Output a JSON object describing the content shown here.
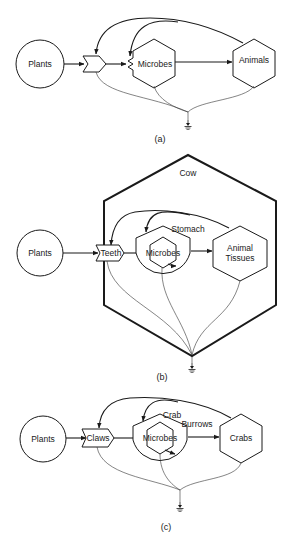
{
  "diagram": {
    "type": "energy-flow-systems",
    "panels": [
      {
        "id": "a",
        "caption": "(a)",
        "nodes": {
          "source": "Plants",
          "consumer_1": "Microbes",
          "consumer_2": "Animals"
        },
        "interaction_gates": 2,
        "flows": [
          {
            "from": "Plants",
            "to": "gate-1"
          },
          {
            "from": "gate-1",
            "to": "Microbes"
          },
          {
            "from": "Microbes",
            "to": "Animals"
          },
          {
            "from": "Animals",
            "to": "gate-1",
            "type": "feedback"
          },
          {
            "from": "Animals",
            "to": "gate-2",
            "type": "feedback"
          },
          {
            "from": "gate-1",
            "to": "heat-sink"
          },
          {
            "from": "Microbes",
            "to": "heat-sink"
          },
          {
            "from": "Animals",
            "to": "heat-sink"
          }
        ]
      },
      {
        "id": "b",
        "caption": "(b)",
        "system_boundary": "Cow",
        "nodes": {
          "source": "Plants",
          "gate": "Teeth",
          "container": "Stomach",
          "consumer_1": "Microbes",
          "consumer_2_line1": "Animal",
          "consumer_2_line2": "Tissues"
        },
        "flows": [
          {
            "from": "Plants",
            "to": "Teeth"
          },
          {
            "from": "Teeth",
            "to": "Microbes"
          },
          {
            "from": "Microbes",
            "to": "Animal Tissues"
          },
          {
            "from": "Animal Tissues",
            "to": "Teeth",
            "type": "feedback"
          },
          {
            "from": "Animal Tissues",
            "to": "Stomach",
            "type": "feedback"
          },
          {
            "from": "Teeth",
            "to": "heat-sink"
          },
          {
            "from": "Microbes",
            "to": "heat-sink"
          },
          {
            "from": "Animal Tissues",
            "to": "heat-sink"
          }
        ]
      },
      {
        "id": "c",
        "caption": "(c)",
        "nodes": {
          "source": "Plants",
          "gate": "Claws",
          "container_line1": "Crab",
          "container_line2": "Burrows",
          "consumer_1": "Microbes",
          "consumer_2": "Crabs"
        },
        "flows": [
          {
            "from": "Plants",
            "to": "Claws"
          },
          {
            "from": "Claws",
            "to": "Microbes"
          },
          {
            "from": "Microbes",
            "to": "Crabs"
          },
          {
            "from": "Crabs",
            "to": "Claws",
            "type": "feedback"
          },
          {
            "from": "Crabs",
            "to": "Crab Burrows",
            "type": "feedback"
          },
          {
            "from": "Claws",
            "to": "heat-sink"
          },
          {
            "from": "Microbes",
            "to": "heat-sink"
          },
          {
            "from": "Crabs",
            "to": "heat-sink"
          }
        ]
      }
    ]
  }
}
